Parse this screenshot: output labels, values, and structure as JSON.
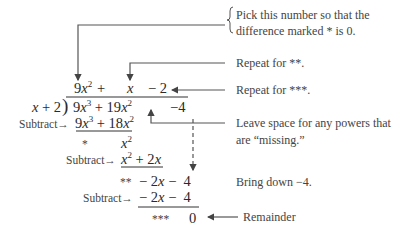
{
  "quotient": {
    "term1": "9x²",
    "plus": "+",
    "term2": "x",
    "term3": "− 2"
  },
  "divisor": "x + 2",
  "dividend": {
    "term1": "9x³",
    "plus": "+",
    "term2": "19x²",
    "term3": "−4"
  },
  "steps": [
    {
      "label": "Subtract→",
      "expr": "9x³ + 18x²"
    },
    {
      "marker": "*",
      "expr": "x²"
    },
    {
      "label": "Subtract→",
      "expr": "x² + 2x"
    },
    {
      "marker": "**",
      "expr": "− 2x −  4"
    },
    {
      "label": "Subtract→",
      "expr": "− 2x −  4"
    },
    {
      "marker": "***",
      "expr": "0"
    }
  ],
  "annotations": {
    "pick_line1": "Pick this number so that the",
    "pick_line2": "difference marked * is 0.",
    "repeat2": "Repeat for **.",
    "repeat3": "Repeat for ***.",
    "leave_line1": "Leave space for any powers that",
    "leave_line2": "are “missing.”",
    "bring_down": "Bring down  −4.",
    "remainder": "Remainder"
  }
}
